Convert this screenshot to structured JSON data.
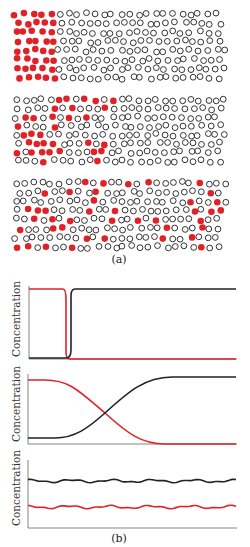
{
  "figure": {
    "label_a": "(a)",
    "label_b": "(b)",
    "colors": {
      "solute": "#e02228",
      "solvent": "#333333",
      "axis": "#555555"
    }
  },
  "particle_panels": [
    {
      "name": "initial-state",
      "description": "red particles concentrated at left edge"
    },
    {
      "name": "intermediate-state",
      "description": "red particles diffusing rightward"
    },
    {
      "name": "equilibrium-state",
      "description": "red particles evenly distributed"
    }
  ],
  "chart_data": [
    {
      "type": "line",
      "title": "",
      "ylabel": "Concentration",
      "xlabel": "",
      "grid": false,
      "series": [
        {
          "name": "solute (red)",
          "color": "#e02228",
          "x": [
            0,
            0.17,
            0.18,
            0.19,
            1.0
          ],
          "y": [
            1.0,
            1.0,
            0.5,
            0.0,
            0.0
          ]
        },
        {
          "name": "solvent (black)",
          "color": "#222222",
          "x": [
            0,
            0.19,
            0.2,
            0.21,
            1.0
          ],
          "y": [
            0.0,
            0.0,
            0.5,
            1.0,
            1.0
          ]
        }
      ]
    },
    {
      "type": "line",
      "title": "",
      "ylabel": "Concentration",
      "xlabel": "",
      "grid": false,
      "series": [
        {
          "name": "solute (red)",
          "color": "#e02228",
          "x": [
            0,
            0.1,
            0.2,
            0.3,
            0.4,
            0.5,
            0.6,
            0.7,
            1.0
          ],
          "y": [
            0.92,
            0.9,
            0.8,
            0.62,
            0.4,
            0.18,
            0.04,
            0.0,
            0.0
          ]
        },
        {
          "name": "solvent (black)",
          "color": "#222222",
          "x": [
            0,
            0.1,
            0.2,
            0.3,
            0.4,
            0.5,
            0.6,
            0.7,
            1.0
          ],
          "y": [
            0.08,
            0.1,
            0.18,
            0.38,
            0.6,
            0.8,
            0.95,
            1.0,
            1.0
          ]
        }
      ]
    },
    {
      "type": "line",
      "title": "",
      "ylabel": "Concentration",
      "xlabel": "",
      "grid": false,
      "series": [
        {
          "name": "solvent (black)",
          "color": "#222222",
          "level": 0.7,
          "fluctuation": "small wavy"
        },
        {
          "name": "solute (red)",
          "color": "#e02228",
          "level": 0.32,
          "fluctuation": "small wavy"
        }
      ]
    }
  ]
}
